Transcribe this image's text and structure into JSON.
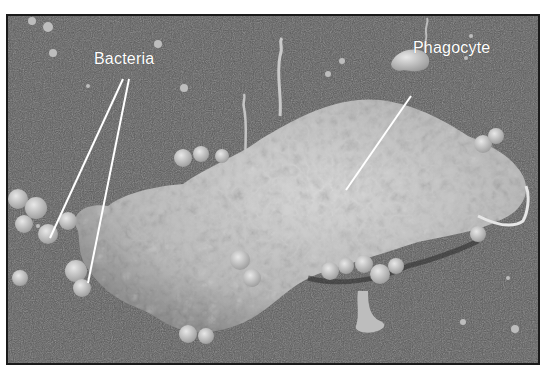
{
  "figure": {
    "type": "scanning electron micrograph",
    "labels": [
      {
        "id": "bacteria",
        "text": "Bacteria"
      },
      {
        "id": "phagocyte",
        "text": "Phagocyte"
      }
    ]
  },
  "colors": {
    "background": "#5a5a5a",
    "cell": "#c8c8c8",
    "label_text": "#ffffff",
    "border": "#1a1a1a"
  }
}
